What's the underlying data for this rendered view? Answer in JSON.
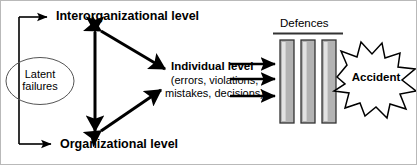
{
  "figure": {
    "background_color": "#ffffff",
    "border_color": "#b9b9b9",
    "width": 417,
    "height": 165
  },
  "nodes": {
    "interorganizational_level": "Interorganizational level",
    "organizational_level": "Organizational level",
    "latent_failures": "Latent failures",
    "individual_level": "Individual level",
    "individual_level_detail": "(errors, violations, mistakes, decisions)",
    "defences": "Defences",
    "accident": "Accident"
  },
  "shapes": {
    "latent_failures_shape": "ellipse",
    "accident_shape": "starburst",
    "defence_bars_count": 3,
    "defence_bar_fill": "#b3b3b3",
    "defence_bar_highlight": "#e2e2e2",
    "defence_bar_stroke": "#333333",
    "line_color": "#000000"
  },
  "connectors": {
    "latent_to_interorganizational": "arrow-right",
    "latent_to_organizational": "arrow-right",
    "interorganizational_to_organizational": "double-arrow-vertical",
    "interorganizational_to_individual": "double-arrow-diagonal",
    "organizational_to_individual": "double-arrow-diagonal",
    "individual_to_defences": "arrow-right",
    "individual_to_defences_count": 3
  }
}
